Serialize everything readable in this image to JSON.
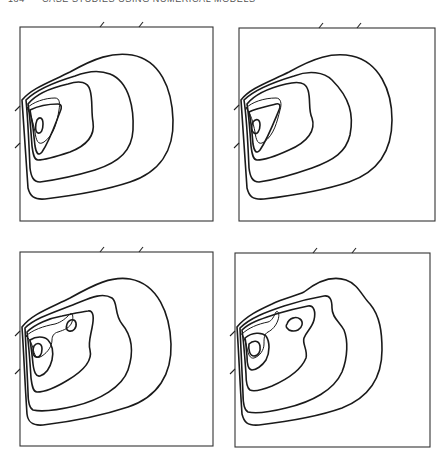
{
  "page": {
    "number": "184",
    "running_head": "CASE STUDIES USING NUMERICAL MODELS"
  },
  "figure": {
    "layout": "2x2 grid of contour plots",
    "panels": [
      {
        "id": "top-left",
        "description": "Nested closed contours with single inner maximum near left boundary",
        "inner_maxima": 1,
        "contour_count": 6
      },
      {
        "id": "top-right",
        "description": "Nested closed contours with single inner maximum near left boundary, elongated inner lobe",
        "inner_maxima": 1,
        "contour_count": 6
      },
      {
        "id": "bottom-left",
        "description": "Nested contours with two inner maxima (main and secondary)",
        "inner_maxima": 2,
        "contour_count": 6
      },
      {
        "id": "bottom-right",
        "description": "Nested contours with two pronounced inner maxima",
        "inner_maxima": 2,
        "contour_count": 6
      }
    ]
  }
}
